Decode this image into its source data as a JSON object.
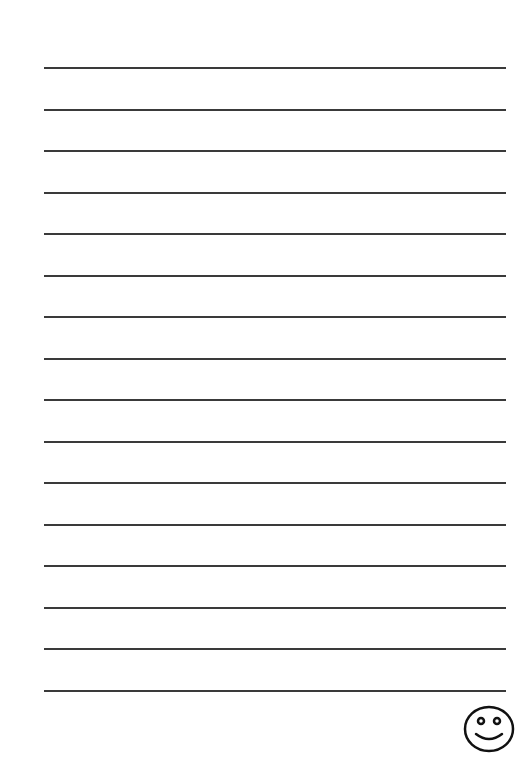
{
  "page": {
    "background": "#ffffff",
    "line_color": "#3a3a3a",
    "line_count": 16,
    "first_line_y": 67,
    "line_spacing": 41.53,
    "line_left_x": 44,
    "line_width": 462,
    "line_thickness": 2
  },
  "decoration": {
    "icon": "smiley-face-icon",
    "position": "bottom-right"
  }
}
